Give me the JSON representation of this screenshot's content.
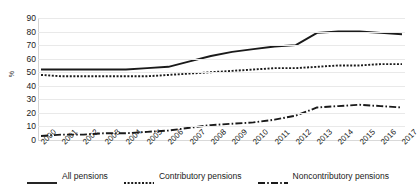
{
  "chart_data": {
    "type": "line",
    "title": "",
    "subtitle": "",
    "xlabel": "",
    "ylabel": "%",
    "ylim": [
      0,
      90
    ],
    "yticks": [
      90,
      80,
      70,
      60,
      50,
      40,
      30,
      20,
      10,
      0
    ],
    "grid": true,
    "legend_position": "bottom",
    "categories": [
      "2000",
      "2001",
      "2002",
      "2003",
      "2004",
      "2005",
      "2006",
      "2007",
      "2008",
      "2009",
      "2010",
      "2011",
      "2012",
      "2013",
      "2014",
      "2015",
      "2016",
      "2017"
    ],
    "series": [
      {
        "name": "All pensions",
        "style": "solid",
        "color": "#1a1a1a",
        "values": [
          52,
          52,
          52,
          52,
          52,
          53,
          54,
          58,
          62,
          65,
          67,
          69,
          70,
          79,
          80,
          80,
          79,
          78
        ]
      },
      {
        "name": "Contributory pensions",
        "style": "dotted",
        "color": "#1a1a1a",
        "values": [
          48,
          47,
          47,
          47,
          47,
          47,
          48,
          49,
          50,
          51,
          52,
          53,
          53,
          54,
          55,
          55,
          56,
          56
        ]
      },
      {
        "name": "Noncontributory pensions",
        "style": "dash-dot",
        "color": "#1a1a1a",
        "values": [
          3,
          4,
          4,
          5,
          5,
          6,
          7,
          9,
          11,
          12,
          13,
          15,
          18,
          24,
          25,
          26,
          25,
          24
        ]
      }
    ]
  },
  "legend": {
    "items": [
      {
        "label": "All pensions",
        "style": "solid"
      },
      {
        "label": "Contributory pensions",
        "style": "dotted"
      },
      {
        "label": "Noncontributory pensions",
        "style": "dash-dot"
      }
    ]
  },
  "colors": {
    "line": "#1a1a1a",
    "grid": "#e9e9e9",
    "background": "#ffffff",
    "text": "#1a1a1a"
  }
}
